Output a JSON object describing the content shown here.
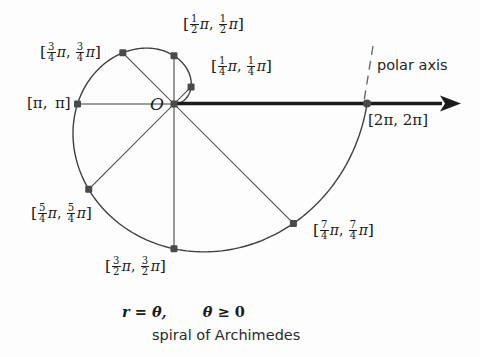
{
  "figure": {
    "title_equation_r": "r",
    "title_equation_eq": "=",
    "title_equation_theta": "θ,",
    "title_equation_theta2": "θ",
    "title_equation_ge": "≥",
    "title_equation_zero": "0",
    "caption": "spiral of Archimedes",
    "origin_label": "O",
    "axis_label": "polar axis",
    "curve_name": "spiral of Archimedes",
    "equation_text": "r = θ,    θ ≥ 0"
  },
  "points": [
    {
      "name": "point-quarter-pi",
      "theta_label": "¼π",
      "label_text": "[¼ π, ¼ π]",
      "num": "1",
      "den": "4",
      "x": 198,
      "y": 66,
      "r": 0.7854,
      "theta_rad": 0.7854
    },
    {
      "name": "point-half-pi",
      "theta_label": "½π",
      "label_text": "[½ π, ½ π]",
      "num": "1",
      "den": "2",
      "x": 177,
      "y": 51,
      "r": 1.5708,
      "theta_rad": 1.5708
    },
    {
      "name": "point-three-quarter-pi",
      "theta_label": "¾π",
      "label_text": "[¾ π, ¾ π]",
      "num": "3",
      "den": "4",
      "x": 123,
      "y": 64,
      "r": 2.3562,
      "theta_rad": 2.3562
    },
    {
      "name": "point-pi",
      "theta_label": "π",
      "label_text": "[π, π]",
      "num": "",
      "den": "",
      "x": 86,
      "y": 104,
      "r": 3.1416,
      "theta_rad": 3.1416
    },
    {
      "name": "point-five-quarter-pi",
      "theta_label": "5π/4",
      "label_text": "[5/4 π, 5/4 π]",
      "num": "5",
      "den": "4",
      "x": 115,
      "y": 214,
      "r": 3.927,
      "theta_rad": 3.927
    },
    {
      "name": "point-three-half-pi",
      "theta_label": "3π/2",
      "label_text": "[3/2 π, 3/2 π]",
      "num": "3",
      "den": "2",
      "x": 177,
      "y": 245,
      "r": 4.7124,
      "theta_rad": 4.7124
    },
    {
      "name": "point-seven-quarter-pi",
      "theta_label": "7π/4",
      "label_text": "[7/4 π, 7/4 π]",
      "num": "7",
      "den": "4",
      "x": 310,
      "y": 208,
      "r": 5.4978,
      "theta_rad": 5.4978
    },
    {
      "name": "point-two-pi",
      "theta_label": "2π",
      "label_text": "[2π, 2π]",
      "num": "",
      "den": "",
      "x": 367,
      "y": 103,
      "r": 6.2832,
      "theta_rad": 6.2832
    }
  ],
  "labels": {
    "quarter_pi_open": "[",
    "quarter_pi_close": "]",
    "comma": ",",
    "pi_glyph": "π",
    "pi_pi": "[π, π]",
    "two_pi_two_pi": "[2π, 2π]"
  },
  "chart_data": {
    "type": "line",
    "title": "spiral of Archimedes",
    "equation": "r = θ,  θ ≥ 0",
    "xlabel": "polar axis",
    "ylabel": "",
    "polar": true,
    "origin": {
      "x": 174,
      "y": 104
    },
    "pixels_per_unit_r": 30.7,
    "theta_values_pi": [
      0.25,
      0.5,
      0.75,
      1.0,
      1.25,
      1.5,
      1.75,
      2.0
    ],
    "r_values_pi": [
      0.25,
      0.5,
      0.75,
      1.0,
      1.25,
      1.5,
      1.75,
      2.0
    ],
    "legend": [],
    "grid": false
  },
  "colors": {
    "ink": "#1b1b1b",
    "curve": "#3a3a3a",
    "axis": "#1b1b1b",
    "marker": "#4a4a4a",
    "background": "#fdfdfd"
  }
}
